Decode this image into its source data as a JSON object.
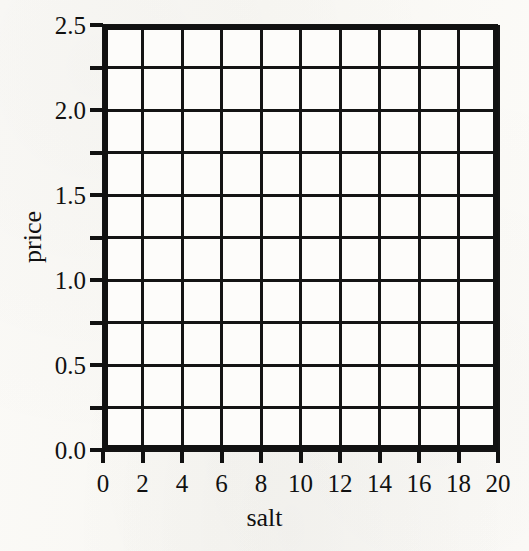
{
  "chart_data": {
    "type": "line",
    "title": "",
    "subtitle": "",
    "xlabel": "salt",
    "ylabel": "price",
    "xlim": [
      0,
      20
    ],
    "ylim": [
      0.0,
      2.5
    ],
    "x_ticks": [
      0,
      2,
      4,
      6,
      8,
      10,
      12,
      14,
      16,
      18,
      20
    ],
    "x_tick_labels": [
      "0",
      "2",
      "4",
      "6",
      "8",
      "10",
      "12",
      "14",
      "16",
      "18",
      "20"
    ],
    "y_ticks": [
      0.0,
      0.5,
      1.0,
      1.5,
      2.0,
      2.5
    ],
    "y_tick_labels": [
      "0.0",
      "0.5",
      "1.0",
      "1.5",
      "2.0",
      "2.5"
    ],
    "x_gridlines": [
      0,
      2,
      4,
      6,
      8,
      10,
      12,
      14,
      16,
      18,
      20
    ],
    "y_gridlines": [
      0.0,
      0.25,
      0.5,
      0.75,
      1.0,
      1.25,
      1.5,
      1.75,
      2.0,
      2.25,
      2.5
    ],
    "x_minor_step": 2,
    "y_minor_step": 0.25,
    "grid": true,
    "legend": null,
    "series": [],
    "values": [],
    "annotations": [],
    "note": "Blank grid — axes and gridlines drawn, no data series plotted",
    "colors": {
      "grid": "#141414",
      "axis": "#111111",
      "text": "#111111",
      "plot_background": "#fdfcfa",
      "page_background": "#faf9f5"
    }
  }
}
